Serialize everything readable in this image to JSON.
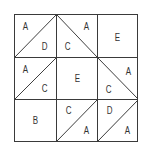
{
  "diagram": {
    "type": "quilt-block-grid",
    "rows": 3,
    "cols": 3,
    "cells": [
      {
        "row": 0,
        "col": 0,
        "diagonal": "up",
        "labels": [
          {
            "text": "A",
            "pos": "top-left"
          },
          {
            "text": "D",
            "pos": "bottom-right"
          }
        ]
      },
      {
        "row": 0,
        "col": 1,
        "diagonal": "down",
        "labels": [
          {
            "text": "A",
            "pos": "top-right"
          },
          {
            "text": "C",
            "pos": "bottom-left"
          }
        ]
      },
      {
        "row": 0,
        "col": 2,
        "diagonal": "none",
        "labels": [
          {
            "text": "E",
            "pos": "center"
          }
        ]
      },
      {
        "row": 1,
        "col": 0,
        "diagonal": "up",
        "labels": [
          {
            "text": "A",
            "pos": "top-left"
          },
          {
            "text": "C",
            "pos": "bottom-right"
          }
        ]
      },
      {
        "row": 1,
        "col": 1,
        "diagonal": "none",
        "labels": [
          {
            "text": "E",
            "pos": "center"
          }
        ]
      },
      {
        "row": 1,
        "col": 2,
        "diagonal": "down",
        "labels": [
          {
            "text": "A",
            "pos": "top-right"
          },
          {
            "text": "C",
            "pos": "bottom-left"
          }
        ]
      },
      {
        "row": 2,
        "col": 0,
        "diagonal": "none",
        "labels": [
          {
            "text": "B",
            "pos": "center"
          }
        ]
      },
      {
        "row": 2,
        "col": 1,
        "diagonal": "up",
        "labels": [
          {
            "text": "C",
            "pos": "top-left"
          },
          {
            "text": "A",
            "pos": "bottom-right"
          }
        ]
      },
      {
        "row": 2,
        "col": 2,
        "diagonal": "up",
        "labels": [
          {
            "text": "D",
            "pos": "top-left"
          },
          {
            "text": "A",
            "pos": "bottom-right"
          }
        ]
      }
    ],
    "line_color": "#3a3a3a"
  }
}
